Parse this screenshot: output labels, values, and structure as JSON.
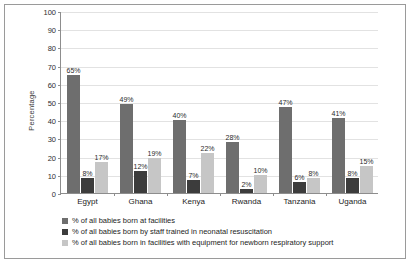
{
  "chart_data": {
    "type": "bar",
    "title": "",
    "xlabel": "",
    "ylabel": "Percentage",
    "ylim": [
      0,
      100
    ],
    "ytick_step": 10,
    "yticks": [
      "100",
      "90",
      "80",
      "70",
      "60",
      "50",
      "40",
      "30",
      "20",
      "10",
      "0"
    ],
    "grid": true,
    "legend_position": "below-axis",
    "categories": [
      "Egypt",
      "Ghana",
      "Kenya",
      "Rwanda",
      "Tanzania",
      "Uganda"
    ],
    "series": [
      {
        "name": "% of all babies born at facilities",
        "color": "#6e6e6e",
        "values": [
          65,
          49,
          40,
          28,
          47,
          41
        ],
        "labels": [
          "65%",
          "49%",
          "40%",
          "28%",
          "47%",
          "41%"
        ]
      },
      {
        "name": "% of all babies born by staff trained in neonatal resuscitation",
        "color": "#3c3c3c",
        "values": [
          8,
          12,
          7,
          2,
          6,
          8
        ],
        "labels": [
          "8%",
          "12%",
          "7%",
          "2%",
          "6%",
          "8%"
        ]
      },
      {
        "name": "% of all babies born in facilities with equipment for newborn respiratory support",
        "color": "#c6c6c6",
        "values": [
          17,
          19,
          22,
          10,
          8,
          15
        ],
        "labels": [
          "17%",
          "19%",
          "22%",
          "10%",
          "8%",
          "15%"
        ]
      }
    ]
  }
}
